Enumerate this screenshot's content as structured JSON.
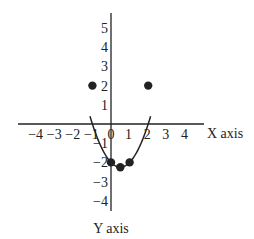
{
  "chart_data": {
    "type": "line",
    "title": "",
    "function": "y = x^2 - x - 2",
    "xlabel": "X axis",
    "ylabel": "Y axis",
    "xlim": [
      -4.9,
      5
    ],
    "ylim": [
      -4.6,
      5.9
    ],
    "grid": false,
    "legend": null,
    "x_ticks": [
      "-4",
      "-3",
      "-2",
      "-1",
      "0",
      "1",
      "2",
      "3",
      "4"
    ],
    "y_ticks": [
      "5",
      "4",
      "3",
      "2",
      "1",
      "-1",
      "-2",
      "-3",
      "-4"
    ],
    "points": [
      {
        "x": -1,
        "y": 2
      },
      {
        "x": 0,
        "y": -2
      },
      {
        "x": 0.5,
        "y": -2.25
      },
      {
        "x": 1,
        "y": -2
      },
      {
        "x": 2,
        "y": 2
      }
    ],
    "curve_x_range": [
      -1.13,
      2.13
    ]
  },
  "colors": {
    "ink": "#222222",
    "background": "#ffffff"
  }
}
